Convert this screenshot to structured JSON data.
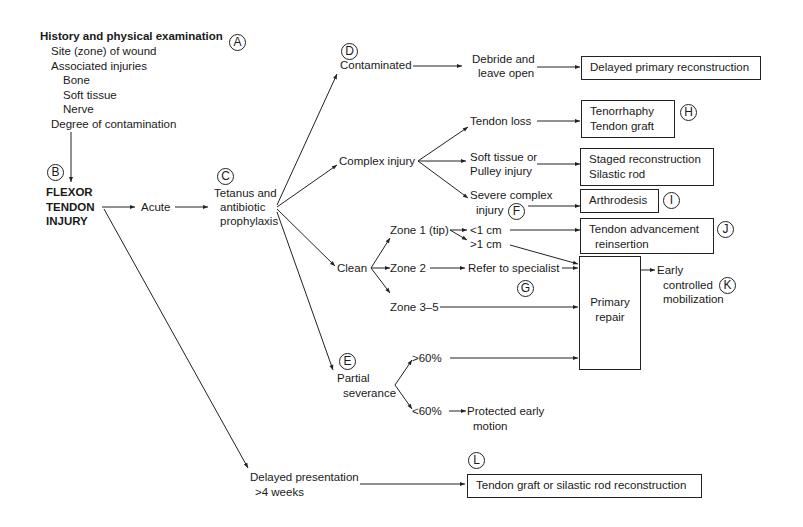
{
  "diagram": {
    "history": {
      "title": "History and physical examination",
      "items": [
        "Site (zone) of wound",
        "Associated injuries",
        "Bone",
        "Soft tissue",
        "Nerve",
        "Degree of contamination"
      ]
    },
    "markers": {
      "A": "A",
      "B": "B",
      "C": "C",
      "D": "D",
      "E": "E",
      "F": "F",
      "G": "G",
      "H": "H",
      "I": "I",
      "J": "J",
      "K": "K",
      "L": "L"
    },
    "root": [
      "FLEXOR",
      "TENDON",
      "INJURY"
    ],
    "acute": "Acute",
    "prophylaxis": [
      "Tetanus and",
      "antibiotic",
      "prophylaxis"
    ],
    "contaminated": "Contaminated",
    "debride": [
      "Debride and",
      "leave open"
    ],
    "delayed_primary": "Delayed primary reconstruction",
    "complex_injury": "Complex injury",
    "tendon_loss": "Tendon loss",
    "tenorrhaphy": [
      "Tenorrhaphy",
      "Tendon graft"
    ],
    "soft_tissue": [
      "Soft tissue or",
      "Pulley injury"
    ],
    "staged": [
      "Staged reconstruction",
      "Silastic rod"
    ],
    "severe": [
      "Severe complex",
      "injury"
    ],
    "arthrodesis": "Arthrodesis",
    "clean": "Clean",
    "zone1": "Zone 1 (tip)",
    "lt1cm": "<1 cm",
    "gt1cm": ">1 cm",
    "advancement": [
      "Tendon advancement",
      "reinsertion"
    ],
    "zone2": "Zone 2",
    "refer": "Refer to specialist",
    "zone35": "Zone 3–5",
    "primary_repair": [
      "Primary",
      "repair"
    ],
    "early": [
      "Early",
      "controlled",
      "mobilization"
    ],
    "partial": [
      "Partial",
      "severance"
    ],
    "gt60": ">60%",
    "lt60": "<60%",
    "protected": [
      "Protected early",
      "motion"
    ],
    "delayed_presentation": [
      "Delayed presentation",
      ">4 weeks"
    ],
    "graft_rod": "Tendon graft or silastic rod reconstruction"
  }
}
